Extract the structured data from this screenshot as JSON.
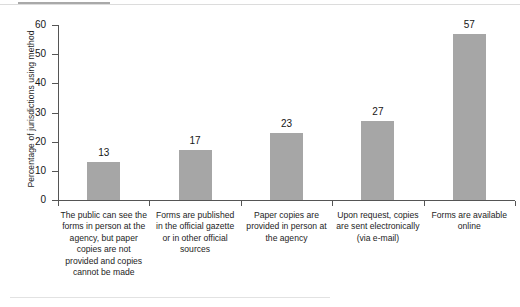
{
  "chart_data": {
    "type": "bar",
    "title": "",
    "xlabel": "",
    "ylabel": "Percentage of jurisdictions using method",
    "ylim": [
      0,
      60
    ],
    "yticks": [
      0,
      10,
      20,
      30,
      40,
      50,
      60
    ],
    "grid": false,
    "legend": "none",
    "bar_color": "#a6a6a6",
    "axis_color": "#555555",
    "categories": [
      "The public can see the forms in person at the agency, but paper copies are not provided and copies cannot be made",
      "Forms are published in the official gazette or in other official sources",
      "Paper copies are provided in person at the agency",
      "Upon request, copies are sent electronically (via e-mail)",
      "Forms are available online"
    ],
    "values": [
      13,
      17,
      23,
      27,
      57
    ],
    "value_labels": [
      "13",
      "17",
      "23",
      "27",
      "57"
    ],
    "ytick_labels": [
      "0",
      "10",
      "20",
      "30",
      "40",
      "50",
      "60"
    ]
  }
}
